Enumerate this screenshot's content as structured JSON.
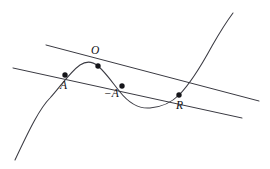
{
  "figure": {
    "background_color": "#ffffff",
    "stroke_color": "#3a3a42",
    "point_color": "#16161a",
    "label_color": "#101014",
    "width": 270,
    "height": 169
  },
  "labels": {
    "origin": "O",
    "point_a": "A",
    "point_neg_a": "−A",
    "point_r": "R"
  },
  "points": [
    {
      "name": "A",
      "label": "A",
      "x": 65,
      "y": 75,
      "label_x": 60,
      "label_y": 80
    },
    {
      "name": "O",
      "label": "O",
      "x": 98,
      "y": 66,
      "label_x": 91,
      "label_y": 45
    },
    {
      "name": "-A",
      "label": "−A",
      "x": 122,
      "y": 86,
      "label_x": 104,
      "label_y": 88
    },
    {
      "name": "R",
      "label": "R",
      "x": 179,
      "y": 95,
      "label_x": 176,
      "label_y": 100
    }
  ],
  "geometry": {
    "curve_path": "M 15 160 C 30 128 40 108 50 98 C 60 87 70 72 80 65 C 86 61 92 61 98 66 C 106 73 112 82 120 92 C 128 102 138 109 150 108 C 162 107 172 102 179 95 C 190 84 200 68 212 46 C 220 32 227 21 233 13",
    "secant_upper": "M 46 45 L 259 101",
    "secant_lower": "M 13 68 L 242 118",
    "marker_radius": 2.7
  },
  "curve_data": {
    "type": "elliptic-curve",
    "description": "Cubic curve with local maximum near x=90 and local minimum near x=152; left branch descends to lower-left, right branch ascends to upper-right.",
    "local_maximum": {
      "x": 90,
      "y": 62
    },
    "local_minimum": {
      "x": 152,
      "y": 108
    },
    "lines": [
      {
        "name": "secant-through-O-and-R",
        "from": [
          46,
          45
        ],
        "to": [
          259,
          101
        ]
      },
      {
        "name": "secant-through-A-negA-R",
        "from": [
          13,
          68
        ],
        "to": [
          242,
          118
        ]
      }
    ]
  }
}
